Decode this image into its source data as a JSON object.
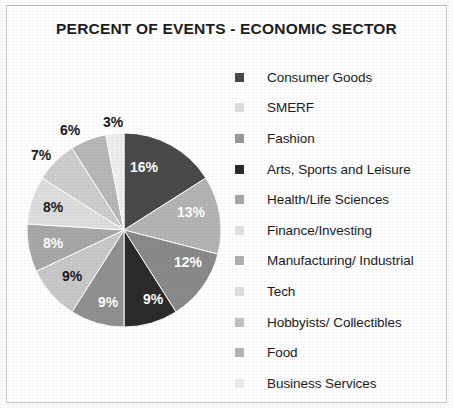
{
  "chart_data": {
    "type": "pie",
    "title": "PERCENT OF EVENTS - ECONOMIC SECTOR",
    "xlabel": "",
    "ylabel": "",
    "legend_position": "right",
    "grid": false,
    "value_suffix": "%",
    "categories": [
      "Consumer Goods",
      "SMERF",
      "Fashion",
      "Arts, Sports and Leisure",
      "Health/Life Sciences",
      "Finance/Investing",
      "Manufacturing/ Industrial",
      "Tech",
      "Hobbyists/ Collectibles",
      "Food",
      "Business Services"
    ],
    "values": [
      16,
      13,
      12,
      9,
      9,
      9,
      8,
      8,
      7,
      6,
      3
    ],
    "labels": [
      "16%",
      "13%",
      "12%",
      "9%",
      "9%",
      "9%",
      "8%",
      "8%",
      "7%",
      "6%",
      "3%"
    ],
    "colors": [
      "#4a4a4a",
      "#b4b4b4",
      "#8a8a8a",
      "#2b2b2b",
      "#909090",
      "#c9c9c9",
      "#a8a8a8",
      "#dedede",
      "#cecece",
      "#b8b8b8",
      "#eeeeee"
    ],
    "slices": [
      {
        "label": "16%",
        "value": 16,
        "category": "Consumer Goods",
        "color": "#4a4a4a",
        "label_color": "light",
        "label_x": 144,
        "label_y": 167
      },
      {
        "label": "13%",
        "value": 13,
        "category": "SMERF",
        "color": "#b4b4b4",
        "label_color": "light",
        "label_x": 191,
        "label_y": 212
      },
      {
        "label": "12%",
        "value": 12,
        "category": "Fashion",
        "color": "#8a8a8a",
        "label_color": "light",
        "label_x": 188,
        "label_y": 262
      },
      {
        "label": "9%",
        "value": 9,
        "category": "Arts, Sports and Leisure",
        "color": "#2b2b2b",
        "label_color": "light",
        "label_x": 153,
        "label_y": 299
      },
      {
        "label": "9%",
        "value": 9,
        "category": "Health/Life Sciences",
        "color": "#909090",
        "label_color": "light",
        "label_x": 108,
        "label_y": 302
      },
      {
        "label": "9%",
        "value": 9,
        "category": "Finance/Investing",
        "color": "#c9c9c9",
        "label_color": "dark",
        "label_x": 72,
        "label_y": 276
      },
      {
        "label": "8%",
        "value": 8,
        "category": "Manufacturing/ Industrial",
        "color": "#a8a8a8",
        "label_color": "light",
        "label_x": 53,
        "label_y": 243
      },
      {
        "label": "8%",
        "value": 8,
        "category": "Tech",
        "color": "#dedede",
        "label_color": "dark",
        "label_x": 53,
        "label_y": 207
      },
      {
        "label": "7%",
        "value": 7,
        "category": "Hobbyists/ Collectibles",
        "color": "#cecece",
        "label_color": "dark",
        "label_x": 41,
        "label_y": 155
      },
      {
        "label": "6%",
        "value": 6,
        "category": "Food",
        "color": "#b8b8b8",
        "label_color": "dark",
        "label_x": 70,
        "label_y": 130
      },
      {
        "label": "3%",
        "value": 3,
        "category": "Business Services",
        "color": "#eeeeee",
        "label_color": "dark",
        "label_x": 113,
        "label_y": 122
      }
    ]
  },
  "legend": {
    "items": [
      {
        "label": "Consumer Goods",
        "color": "#4a4a4a"
      },
      {
        "label": "SMERF",
        "color": "#dedede"
      },
      {
        "label": "Fashion",
        "color": "#9a9a9a"
      },
      {
        "label": "Arts, Sports and Leisure",
        "color": "#2b2b2b"
      },
      {
        "label": "Health/Life Sciences",
        "color": "#a8a8a8"
      },
      {
        "label": "Finance/Investing",
        "color": "#e2e2e2"
      },
      {
        "label": "Manufacturing/ Industrial",
        "color": "#b0b0b0"
      },
      {
        "label": "Tech",
        "color": "#e0e0e0"
      },
      {
        "label": "Hobbyists/ Collectibles",
        "color": "#c2c2c2"
      },
      {
        "label": "Food",
        "color": "#b4b4b4"
      },
      {
        "label": "Business Services",
        "color": "#ececec"
      }
    ]
  }
}
